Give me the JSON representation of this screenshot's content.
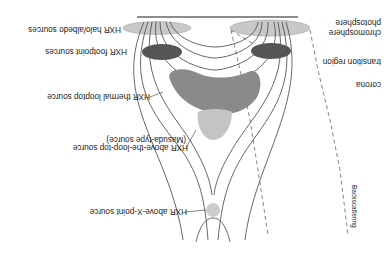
{
  "diagram": {
    "orientation": "rotated 180 degrees",
    "sources": {
      "halo_albedo": "HXR halo/albedo sources",
      "footpoint": "HXR footpoint sources",
      "thermal_looptop": "HXR thermal looptop source",
      "above_looptop_line1": "HXR above-the-loop-top source",
      "above_looptop_line2": "(Masuda-type source)",
      "above_xpoint": "HXR above-X-point source"
    },
    "layers": {
      "photosphere": "photosphere",
      "chromosphere": "chromosphere",
      "transition_region": "transition region",
      "corona": "corona"
    },
    "backscattering": "Backscattering",
    "colors": {
      "halo_ellipse": "#c8c8c8",
      "footpoint_ellipse": "#555555",
      "thermal_looptop": "#8a8a8a",
      "masuda_source": "#c4c4c4",
      "xpoint_source": "#cccccc",
      "field_lines": "#555555",
      "surface_line": "#666666"
    }
  }
}
